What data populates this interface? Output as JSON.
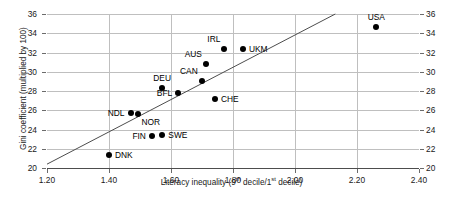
{
  "chart_data": {
    "type": "scatter",
    "title": "",
    "xlabel": "Literacy inequality (9th decile/1st decile)",
    "xlabel_parts": {
      "pre": "Literacy inequality (9",
      "sup1": "th",
      "mid": " decile/1",
      "sup2": "st",
      "post": " decile)"
    },
    "ylabel": "Gini coefficient (multiplied by 100)",
    "xlim": [
      1.2,
      2.4
    ],
    "ylim": [
      20,
      36
    ],
    "xticks": [
      "1.20",
      "1.40",
      "1.60",
      "1.80",
      "2.00",
      "2.20",
      "2.40"
    ],
    "xtick_values": [
      1.2,
      1.4,
      1.6,
      1.8,
      2.0,
      2.2,
      2.4
    ],
    "yticks": [
      "20",
      "22",
      "24",
      "26",
      "28",
      "30",
      "32",
      "34",
      "36"
    ],
    "ytick_values": [
      20,
      22,
      24,
      26,
      28,
      30,
      32,
      34,
      36
    ],
    "grid": true,
    "grid_axis": "both",
    "y_axis_both_sides": true,
    "legend": "none",
    "marker_color": "#000000",
    "grid_color": "#bfbfbf",
    "trendline": {
      "type": "line",
      "x": [
        1.2,
        2.13
      ],
      "y": [
        20.4,
        36.0
      ],
      "color": "#4d4d4d"
    },
    "points": [
      {
        "label": "DNK",
        "x": 1.4,
        "y": 21.3,
        "label_pos": "right"
      },
      {
        "label": "NDL",
        "x": 1.47,
        "y": 25.7,
        "label_pos": "left"
      },
      {
        "label": "NOR",
        "x": 1.492,
        "y": 25.6,
        "label_pos": "below-right"
      },
      {
        "label": "FIN",
        "x": 1.54,
        "y": 23.3,
        "label_pos": "left"
      },
      {
        "label": "SWE",
        "x": 1.572,
        "y": 23.4,
        "label_pos": "right"
      },
      {
        "label": "DEU",
        "x": 1.572,
        "y": 28.3,
        "label_pos": "above"
      },
      {
        "label": "BFL",
        "x": 1.622,
        "y": 27.8,
        "label_pos": "left"
      },
      {
        "label": "CAN",
        "x": 1.7,
        "y": 29.0,
        "label_pos": "above-left"
      },
      {
        "label": "AUS",
        "x": 1.712,
        "y": 30.8,
        "label_pos": "above-left"
      },
      {
        "label": "CHE",
        "x": 1.742,
        "y": 27.2,
        "label_pos": "right"
      },
      {
        "label": "IRL",
        "x": 1.772,
        "y": 32.4,
        "label_pos": "above-left"
      },
      {
        "label": "UKM",
        "x": 1.832,
        "y": 32.4,
        "label_pos": "right"
      },
      {
        "label": "USA",
        "x": 2.262,
        "y": 34.7,
        "label_pos": "above"
      }
    ]
  }
}
